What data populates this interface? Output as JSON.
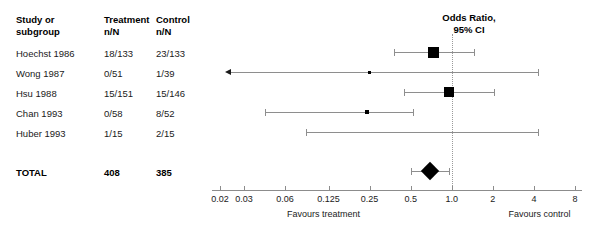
{
  "table": {
    "headers": {
      "study": "Study or",
      "study2": "subgroup",
      "treatment": "Treatment",
      "treatment2": "n/N",
      "control": "Control",
      "control2": "n/N"
    },
    "rows": [
      {
        "study": "Hoechst 1986",
        "treatment": "18/133",
        "control": "23/133"
      },
      {
        "study": "Wong 1987",
        "treatment": "0/51",
        "control": "1/39"
      },
      {
        "study": "Hsu 1988",
        "treatment": "15/151",
        "control": "15/146"
      },
      {
        "study": "Chan 1993",
        "treatment": "0/58",
        "control": "8/52"
      },
      {
        "study": "Huber 1993",
        "treatment": "1/15",
        "control": "2/15"
      }
    ],
    "total": {
      "study": "TOTAL",
      "treatment": "408",
      "control": "385"
    }
  },
  "plot": {
    "title_line1": "Odds Ratio,",
    "title_line2": "95% CI",
    "favours_left": "Favours treatment",
    "favours_right": "Favours control"
  },
  "chart_data": {
    "type": "forest",
    "title": "Odds Ratio, 95% CI",
    "xlabel": "Odds Ratio",
    "xscale": "log",
    "xlim": [
      0.0175,
      9.0
    ],
    "null_value": 1.0,
    "ticks": [
      0.02,
      0.03,
      0.06,
      0.125,
      0.25,
      0.5,
      1.0,
      2,
      4,
      8
    ],
    "tick_labels": [
      "0.02",
      "0.03",
      "0.06",
      "0.125",
      "0.25",
      "0.5",
      "1.0",
      "2",
      "4",
      "8"
    ],
    "grid": false,
    "legend": "none",
    "left_annotation": "Favours treatment",
    "right_annotation": "Favours control",
    "studies": [
      {
        "label": "Hoechst 1986",
        "treatment": "18/133",
        "control": "23/133",
        "or": 0.74,
        "ci_low": 0.38,
        "ci_high": 1.45,
        "marker_size": 11,
        "arrow_left": false
      },
      {
        "label": "Wong 1987",
        "treatment": "0/51",
        "control": "1/39",
        "or": 0.25,
        "ci_low": 0.012,
        "ci_high": 4.3,
        "marker_size": 3,
        "arrow_left": true
      },
      {
        "label": "Hsu 1988",
        "treatment": "15/151",
        "control": "15/146",
        "or": 0.96,
        "ci_low": 0.45,
        "ci_high": 2.05,
        "marker_size": 10,
        "arrow_left": false
      },
      {
        "label": "Chan 1993",
        "treatment": "0/58",
        "control": "8/52",
        "or": 0.24,
        "ci_low": 0.043,
        "ci_high": 0.52,
        "marker_size": 4,
        "arrow_left": false
      },
      {
        "label": "Huber 1993",
        "treatment": "1/15",
        "control": "2/15",
        "or": 0.58,
        "ci_low": 0.085,
        "ci_high": 4.3,
        "marker_size": 0,
        "arrow_left": false
      }
    ],
    "total": {
      "label": "TOTAL",
      "treatment": "408",
      "control": "385",
      "or": 0.69,
      "ci_low": 0.5,
      "ci_high": 0.96
    }
  }
}
